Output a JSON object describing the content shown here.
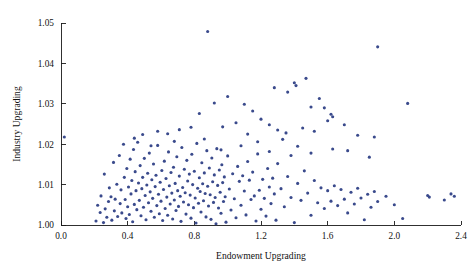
{
  "chart_data": {
    "type": "scatter",
    "title": "",
    "xlabel": "Endowment Upgrading",
    "ylabel": "Industry Upgrading",
    "xlim": [
      0.0,
      2.4
    ],
    "ylim": [
      1.0,
      1.05
    ],
    "xticks": [
      "0.0",
      "0.4",
      "0.8",
      "1.2",
      "1.6",
      "2.0",
      "2.4"
    ],
    "xtick_values": [
      0.0,
      0.4,
      0.8,
      1.2,
      1.6,
      2.0,
      2.4
    ],
    "yticks": [
      "1.00",
      "1.01",
      "1.02",
      "1.03",
      "1.04",
      "1.05"
    ],
    "ytick_values": [
      1.0,
      1.01,
      1.02,
      1.03,
      1.04,
      1.05
    ],
    "grid": false,
    "legend": null,
    "marker_color": "#3a4a8c",
    "marker_size": 1.55,
    "axis_color": "#1a1a1a",
    "background_color": "#ffffff",
    "series": [
      {
        "name": "observations",
        "points": [
          [
            0.02,
            1.0218
          ],
          [
            0.21,
            1.001
          ],
          [
            0.22,
            1.0049
          ],
          [
            0.235,
            1.0031
          ],
          [
            0.24,
            1.0072
          ],
          [
            0.255,
            1.0006
          ],
          [
            0.26,
            1.0126
          ],
          [
            0.265,
            1.004
          ],
          [
            0.275,
            1.0019
          ],
          [
            0.285,
            1.0058
          ],
          [
            0.29,
            1.0092
          ],
          [
            0.3,
            1.007
          ],
          [
            0.305,
            1.0012
          ],
          [
            0.315,
            1.0155
          ],
          [
            0.32,
            1.0035
          ],
          [
            0.325,
            1.0064
          ],
          [
            0.335,
            1.0101
          ],
          [
            0.34,
            1.0021
          ],
          [
            0.35,
            1.0172
          ],
          [
            0.355,
            1.0053
          ],
          [
            0.36,
            1.0087
          ],
          [
            0.365,
            1.003
          ],
          [
            0.375,
            1.02
          ],
          [
            0.38,
            1.0118
          ],
          [
            0.385,
            1.0063
          ],
          [
            0.39,
            1.0016
          ],
          [
            0.395,
            1.014
          ],
          [
            0.4,
            1.0045
          ],
          [
            0.405,
            1.0094
          ],
          [
            0.41,
            1.0026
          ],
          [
            0.415,
            1.0163
          ],
          [
            0.42,
            1.0077
          ],
          [
            0.425,
            1.011
          ],
          [
            0.43,
            1.0008
          ],
          [
            0.435,
            1.0187
          ],
          [
            0.44,
            1.0051
          ],
          [
            0.445,
            1.0132
          ],
          [
            0.45,
            1.0085
          ],
          [
            0.455,
            1.0038
          ],
          [
            0.46,
            1.0205
          ],
          [
            0.465,
            1.0104
          ],
          [
            0.47,
            1.0061
          ],
          [
            0.475,
            1.0147
          ],
          [
            0.48,
            1.0023
          ],
          [
            0.485,
            1.009
          ],
          [
            0.49,
            1.0118
          ],
          [
            0.495,
            1.0044
          ],
          [
            0.5,
            1.0165
          ],
          [
            0.505,
            1.0073
          ],
          [
            0.51,
            1.0013
          ],
          [
            0.515,
            1.0099
          ],
          [
            0.52,
            1.0128
          ],
          [
            0.525,
            1.0055
          ],
          [
            0.53,
            1.0178
          ],
          [
            0.535,
            1.0082
          ],
          [
            0.54,
            1.0034
          ],
          [
            0.545,
            1.0112
          ],
          [
            0.55,
            1.0066
          ],
          [
            0.555,
            1.0151
          ],
          [
            0.56,
            1.0019
          ],
          [
            0.565,
            1.0095
          ],
          [
            0.57,
            1.0123
          ],
          [
            0.575,
            1.0048
          ],
          [
            0.58,
            1.0197
          ],
          [
            0.585,
            1.0076
          ],
          [
            0.59,
            1.0028
          ],
          [
            0.595,
            1.0106
          ],
          [
            0.6,
            1.0059
          ],
          [
            0.605,
            1.0135
          ],
          [
            0.61,
            1.0011
          ],
          [
            0.615,
            1.0088
          ],
          [
            0.62,
            1.0158
          ],
          [
            0.625,
            1.0041
          ],
          [
            0.63,
            1.0115
          ],
          [
            0.635,
            1.0069
          ],
          [
            0.64,
            1.0024
          ],
          [
            0.645,
            1.0181
          ],
          [
            0.65,
            1.0097
          ],
          [
            0.655,
            1.0052
          ],
          [
            0.66,
            1.013
          ],
          [
            0.665,
            1.0079
          ],
          [
            0.67,
            1.0015
          ],
          [
            0.675,
            1.0143
          ],
          [
            0.68,
            1.0062
          ],
          [
            0.685,
            1.0103
          ],
          [
            0.69,
            1.0036
          ],
          [
            0.695,
            1.0169
          ],
          [
            0.7,
            1.0085
          ],
          [
            0.705,
            1.0046
          ],
          [
            0.71,
            1.0121
          ],
          [
            0.715,
            1.0071
          ],
          [
            0.72,
            1.0009
          ],
          [
            0.725,
            1.0192
          ],
          [
            0.73,
            1.0093
          ],
          [
            0.735,
            1.0057
          ],
          [
            0.74,
            1.0138
          ],
          [
            0.745,
            1.008
          ],
          [
            0.75,
            1.0027
          ],
          [
            0.755,
            1.016
          ],
          [
            0.76,
            1.0109
          ],
          [
            0.765,
            1.005
          ],
          [
            0.77,
            1.0126
          ],
          [
            0.775,
            1.0074
          ],
          [
            0.78,
            1.0017
          ],
          [
            0.785,
            1.0175
          ],
          [
            0.79,
            1.01
          ],
          [
            0.795,
            1.0043
          ],
          [
            0.8,
            1.0133
          ],
          [
            0.805,
            1.0067
          ],
          [
            0.81,
            1.0005
          ],
          [
            0.815,
            1.0202
          ],
          [
            0.82,
            1.0091
          ],
          [
            0.825,
            1.0054
          ],
          [
            0.83,
            1.0117
          ],
          [
            0.835,
            1.0083
          ],
          [
            0.84,
            1.0032
          ],
          [
            0.845,
            1.0154
          ],
          [
            0.85,
            1.0102
          ],
          [
            0.855,
            1.006
          ],
          [
            0.86,
            1.0129
          ],
          [
            0.865,
            1.0078
          ],
          [
            0.87,
            1.002
          ],
          [
            0.875,
            1.0184
          ],
          [
            0.88,
            1.0096
          ],
          [
            0.885,
            1.0047
          ],
          [
            0.89,
            1.0141
          ],
          [
            0.895,
            1.0075
          ],
          [
            0.9,
            1.0014
          ],
          [
            0.905,
            1.0166
          ],
          [
            0.91,
            1.0107
          ],
          [
            0.915,
            1.0056
          ],
          [
            0.92,
            1.0124
          ],
          [
            0.925,
            1.0068
          ],
          [
            0.93,
            1.0003
          ],
          [
            0.935,
            1.0189
          ],
          [
            0.94,
            1.0098
          ],
          [
            0.945,
            1.0042
          ],
          [
            0.95,
            1.0136
          ],
          [
            0.955,
            1.0081
          ],
          [
            0.96,
            1.0029
          ],
          [
            0.965,
            1.0149
          ],
          [
            0.97,
            1.0105
          ],
          [
            0.975,
            1.0058
          ],
          [
            0.98,
            1.0119
          ],
          [
            0.985,
            1.007
          ],
          [
            0.99,
            1.0007
          ],
          [
            1.0,
            1.0171
          ],
          [
            1.01,
            1.0089
          ],
          [
            1.02,
            1.0037
          ],
          [
            1.03,
            1.0127
          ],
          [
            1.04,
            1.0065
          ],
          [
            1.05,
            1.0018
          ],
          [
            1.06,
            1.0145
          ],
          [
            1.07,
            1.0108
          ],
          [
            1.08,
            1.0049
          ],
          [
            1.09,
            1.0122
          ],
          [
            1.1,
            1.0084
          ],
          [
            1.11,
            1.0025
          ],
          [
            1.12,
            1.0157
          ],
          [
            1.13,
            1.0111
          ],
          [
            1.14,
            1.0063
          ],
          [
            1.15,
            1.0131
          ],
          [
            1.16,
            1.0072
          ],
          [
            1.17,
            1.001
          ],
          [
            1.18,
            1.0176
          ],
          [
            1.19,
            1.0086
          ],
          [
            1.2,
            1.0039
          ],
          [
            1.21,
            1.0113
          ],
          [
            1.22,
            1.0066
          ],
          [
            1.23,
            1.0022
          ],
          [
            1.24,
            1.014
          ],
          [
            1.25,
            1.0094
          ],
          [
            1.26,
            1.0053
          ],
          [
            1.27,
            1.0116
          ],
          [
            1.28,
            1.0077
          ],
          [
            1.29,
            1.0012
          ],
          [
            1.3,
            1.0152
          ],
          [
            1.32,
            1.009
          ],
          [
            1.34,
            1.0045
          ],
          [
            1.36,
            1.012
          ],
          [
            1.38,
            1.0068
          ],
          [
            1.4,
            1.0006
          ],
          [
            1.42,
            1.0103
          ],
          [
            1.44,
            1.0061
          ],
          [
            1.46,
            1.0134
          ],
          [
            1.48,
            1.0079
          ],
          [
            1.5,
            1.0024
          ],
          [
            1.52,
            1.011
          ],
          [
            1.54,
            1.0055
          ],
          [
            1.56,
            1.0092
          ],
          [
            1.58,
            1.0041
          ],
          [
            1.6,
            1.0085
          ],
          [
            1.62,
            1.0059
          ],
          [
            1.64,
            1.0097
          ],
          [
            1.66,
            1.0048
          ],
          [
            1.68,
            1.0088
          ],
          [
            1.7,
            1.0064
          ],
          [
            1.72,
            1.003
          ],
          [
            1.74,
            1.0081
          ],
          [
            1.76,
            1.0052
          ],
          [
            1.78,
            1.0091
          ],
          [
            1.8,
            1.0067
          ],
          [
            1.82,
            1.0013
          ],
          [
            1.84,
            1.0076
          ],
          [
            1.86,
            1.0044
          ],
          [
            1.88,
            1.0083
          ],
          [
            1.9,
            1.0058
          ],
          [
            1.95,
            1.0071
          ],
          [
            2.0,
            1.005
          ],
          [
            2.05,
            1.0016
          ],
          [
            2.2,
            1.0073
          ],
          [
            2.21,
            1.0069
          ],
          [
            2.3,
            1.0062
          ],
          [
            2.34,
            1.0077
          ],
          [
            2.36,
            1.0071
          ],
          [
            0.88,
            1.0479
          ],
          [
            1.9,
            1.0441
          ],
          [
            1.47,
            1.0363
          ],
          [
            1.4,
            1.0352
          ],
          [
            1.28,
            1.034
          ],
          [
            1.41,
            1.0345
          ],
          [
            1.36,
            1.0329
          ],
          [
            1.55,
            1.0313
          ],
          [
            1.5,
            1.0292
          ],
          [
            1.58,
            1.029
          ],
          [
            1.62,
            1.0274
          ],
          [
            1.63,
            1.0268
          ],
          [
            1.6,
            1.0258
          ],
          [
            0.83,
            1.0276
          ],
          [
            1.1,
            1.0299
          ],
          [
            1.15,
            1.0282
          ],
          [
            1.2,
            1.0262
          ],
          [
            1.25,
            1.0248
          ],
          [
            1.05,
            1.0253
          ],
          [
            0.97,
            1.0243
          ],
          [
            1.3,
            1.0235
          ],
          [
            1.35,
            1.0228
          ],
          [
            0.92,
            1.0302
          ],
          [
            1.0,
            1.0318
          ],
          [
            0.78,
            1.0242
          ],
          [
            0.71,
            1.0236
          ],
          [
            0.64,
            1.0226
          ],
          [
            1.45,
            1.024
          ],
          [
            1.52,
            1.0232
          ],
          [
            1.7,
            1.0248
          ],
          [
            1.78,
            1.0222
          ],
          [
            2.08,
            1.0301
          ],
          [
            1.12,
            1.0225
          ],
          [
            0.58,
            1.0232
          ],
          [
            0.49,
            1.0224
          ],
          [
            0.44,
            1.0215
          ],
          [
            1.88,
            1.0218
          ],
          [
            1.33,
            1.0212
          ],
          [
            1.18,
            1.0206
          ],
          [
            0.86,
            1.0213
          ],
          [
            0.68,
            1.0207
          ],
          [
            1.08,
            1.0196
          ],
          [
            1.42,
            1.0195
          ],
          [
            0.54,
            1.0196
          ],
          [
            1.63,
            1.0188
          ],
          [
            1.72,
            1.0184
          ],
          [
            1.25,
            1.0182
          ],
          [
            0.96,
            1.0186
          ],
          [
            1.5,
            1.0178
          ],
          [
            1.38,
            1.0172
          ],
          [
            1.85,
            1.0168
          ]
        ]
      }
    ]
  }
}
